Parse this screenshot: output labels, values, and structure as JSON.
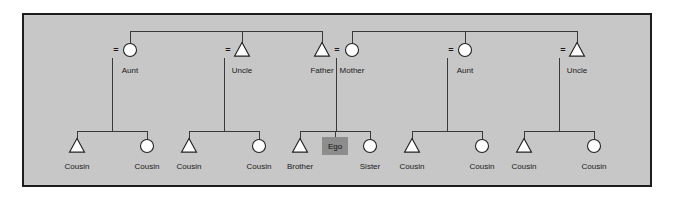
{
  "diagram": {
    "type": "kinship-genealogy",
    "colors": {
      "page_background": "#ffffff",
      "panel_background": "#c7c7c7",
      "panel_border": "#1d1d1d",
      "line": "#3a3a3a",
      "symbol_fill": "#ffffff",
      "symbol_stroke": "#222222",
      "ego_fill": "#8d8d8d",
      "text": "#1a1a1a"
    },
    "legend": {
      "male_symbol": "triangle",
      "female_symbol": "circle",
      "ego_symbol": "shaded-square",
      "marriage_symbol": "="
    },
    "generations": [
      {
        "name": "parents-generation",
        "row_y": 50,
        "label_y": 66,
        "persons": [
          {
            "id": "p1",
            "label": "Aunt",
            "sex": "female",
            "shape": "circle",
            "x": 130,
            "marriage_mark": "=",
            "marriage_mark_x": 116,
            "descent_x": 112
          },
          {
            "id": "p2",
            "label": "Uncle",
            "sex": "male",
            "shape": "triangle",
            "x": 242,
            "marriage_mark": "=",
            "marriage_mark_x": 228,
            "descent_x": 224
          },
          {
            "id": "p3",
            "label": "Father",
            "sex": "male",
            "shape": "triangle",
            "x": 322,
            "marriage_mark": "",
            "marriage_mark_x": 0,
            "descent_x": 0
          },
          {
            "id": "p4",
            "label": "Mother",
            "sex": "female",
            "shape": "circle",
            "x": 352,
            "marriage_mark": "=",
            "marriage_mark_x": 337,
            "descent_x": 336
          },
          {
            "id": "p5",
            "label": "Aunt",
            "sex": "female",
            "shape": "circle",
            "x": 465,
            "marriage_mark": "=",
            "marriage_mark_x": 451,
            "descent_x": 447
          },
          {
            "id": "p6",
            "label": "Uncle",
            "sex": "male",
            "shape": "triangle",
            "x": 577,
            "marriage_mark": "=",
            "marriage_mark_x": 563,
            "descent_x": 559
          }
        ],
        "sibling_bars": [
          {
            "id": "paternal-sibship",
            "x1": 130,
            "x2": 322,
            "y": 31,
            "stems": [
              130,
              242,
              322
            ]
          },
          {
            "id": "maternal-sibship",
            "x1": 352,
            "x2": 577,
            "y": 31,
            "stems": [
              352,
              465,
              577
            ]
          }
        ]
      },
      {
        "name": "ego-generation",
        "row_y": 146,
        "label_y": 162,
        "persons": [
          {
            "id": "c1",
            "label": "Cousin",
            "sex": "male",
            "shape": "triangle",
            "x": 77
          },
          {
            "id": "c2",
            "label": "Cousin",
            "sex": "female",
            "shape": "circle",
            "x": 147
          },
          {
            "id": "c3",
            "label": "Cousin",
            "sex": "male",
            "shape": "triangle",
            "x": 189
          },
          {
            "id": "c4",
            "label": "Cousin",
            "sex": "female",
            "shape": "circle",
            "x": 259
          },
          {
            "id": "c5",
            "label": "Brother",
            "sex": "male",
            "shape": "triangle",
            "x": 300
          },
          {
            "id": "c6",
            "label": "Ego",
            "sex": "ego",
            "shape": "square",
            "x": 335
          },
          {
            "id": "c7",
            "label": "Sister",
            "sex": "female",
            "shape": "circle",
            "x": 370
          },
          {
            "id": "c8",
            "label": "Cousin",
            "sex": "male",
            "shape": "triangle",
            "x": 412
          },
          {
            "id": "c9",
            "label": "Cousin",
            "sex": "female",
            "shape": "circle",
            "x": 482
          },
          {
            "id": "c10",
            "label": "Cousin",
            "sex": "male",
            "shape": "triangle",
            "x": 524
          },
          {
            "id": "c11",
            "label": "Cousin",
            "sex": "female",
            "shape": "circle",
            "x": 594
          }
        ],
        "sibship_bars": [
          {
            "id": "sibship-1",
            "x1": 77,
            "x2": 147,
            "y": 131,
            "descent_x": 112,
            "children": [
              "c1",
              "c2"
            ]
          },
          {
            "id": "sibship-2",
            "x1": 189,
            "x2": 259,
            "y": 131,
            "descent_x": 224,
            "children": [
              "c3",
              "c4"
            ]
          },
          {
            "id": "sibship-3",
            "x1": 300,
            "x2": 370,
            "y": 131,
            "descent_x": 336,
            "children": [
              "c5",
              "c6",
              "c7"
            ]
          },
          {
            "id": "sibship-4",
            "x1": 412,
            "x2": 482,
            "y": 131,
            "descent_x": 447,
            "children": [
              "c8",
              "c9"
            ]
          },
          {
            "id": "sibship-5",
            "x1": 524,
            "x2": 594,
            "y": 131,
            "descent_x": 559,
            "children": [
              "c10",
              "c11"
            ]
          }
        ]
      }
    ]
  }
}
